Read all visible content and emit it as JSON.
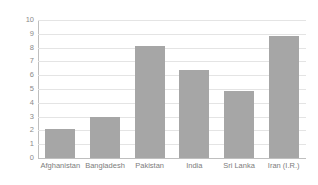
{
  "chart_data": {
    "type": "bar",
    "title": "",
    "subtitle": "",
    "xlabel": "",
    "ylabel": "",
    "categories": [
      "Afghanistan",
      "Bangladesh",
      "Pakistan",
      "India",
      "Sri Lanka",
      "Iran (I.R.)"
    ],
    "values": [
      2.1,
      2.95,
      8.1,
      6.4,
      4.85,
      8.85
    ],
    "series": [
      {
        "name": "",
        "values": [
          2.1,
          2.95,
          8.1,
          6.4,
          4.85,
          8.85
        ]
      }
    ],
    "ylim": [
      0,
      10
    ],
    "ytick_step": 1,
    "ytick_labels": [
      "0",
      "1",
      "2",
      "3",
      "4",
      "5",
      "6",
      "7",
      "8",
      "9",
      "10"
    ],
    "grid": true,
    "grid_axis": "y",
    "legend": false,
    "legend_position": "none",
    "annotations": [],
    "colors": {
      "bar": "#a6a6a6",
      "gridline": "#e4e4e4",
      "axis": "#bfbfbf",
      "tick_text": "#8a8a8a",
      "category_text": "#7d7d7d",
      "background": "#ffffff"
    }
  }
}
